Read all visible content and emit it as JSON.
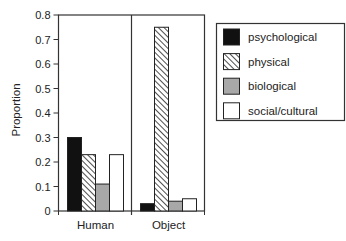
{
  "chart_data": {
    "type": "bar",
    "title": "",
    "xlabel": "",
    "ylabel": "Proportion",
    "ylim": [
      0,
      0.8
    ],
    "yticks": [
      0,
      0.1,
      0.2,
      0.3,
      0.4,
      0.5,
      0.6,
      0.7,
      0.8
    ],
    "ytick_labels": [
      "0",
      "0.1",
      "0.2",
      "0.3",
      "0.4",
      "0.5",
      "0.6",
      "0.7",
      "0.8"
    ],
    "grid": false,
    "legend_position": "right",
    "categories": [
      "Human",
      "Object"
    ],
    "series": [
      {
        "name": "psychological",
        "values": [
          0.3,
          0.03
        ],
        "fill": "solid-black",
        "color": "#111111"
      },
      {
        "name": "physical",
        "values": [
          0.23,
          0.75
        ],
        "fill": "diagonal-hatch",
        "color": "#ffffff"
      },
      {
        "name": "biological",
        "values": [
          0.11,
          0.04
        ],
        "fill": "solid-gray",
        "color": "#a8a8a8"
      },
      {
        "name": "social/cultural",
        "values": [
          0.23,
          0.05
        ],
        "fill": "solid-white",
        "color": "#ffffff"
      }
    ]
  }
}
